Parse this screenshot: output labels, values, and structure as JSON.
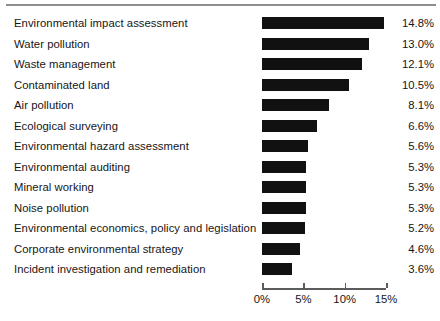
{
  "chart_data": {
    "type": "bar",
    "orientation": "horizontal",
    "title": "",
    "subtitle": "",
    "xlabel": "",
    "ylabel": "",
    "xlim": [
      0,
      15
    ],
    "grid": false,
    "legend": null,
    "categories": [
      "Environmental impact assessment",
      "Water pollution",
      "Waste management",
      "Contaminated land",
      "Air pollution",
      "Ecological surveying",
      "Environmental hazard assessment",
      "Environmental auditing",
      "Mineral working",
      "Noise pollution",
      "Environmental economics, policy and legislation",
      "Corporate environmental strategy",
      "Incident investigation and remediation"
    ],
    "values": [
      14.8,
      13.0,
      12.1,
      10.5,
      8.1,
      6.6,
      5.6,
      5.3,
      5.3,
      5.3,
      5.2,
      4.6,
      3.6
    ],
    "value_labels": [
      "14.8%",
      "13.0%",
      "12.1%",
      "10.5%",
      "8.1%",
      "6.6%",
      "5.6%",
      "5.3%",
      "5.3%",
      "5.3%",
      "5.2%",
      "4.6%",
      "3.6%"
    ],
    "xticks": [
      0,
      5,
      10,
      15
    ],
    "xtick_labels": [
      "0%",
      "5%",
      "10%",
      "15%"
    ],
    "bar_color": "#111111",
    "axis_color": "#5c5c5c",
    "rule_color": "#8d8d8d",
    "text_color": "#161616"
  }
}
